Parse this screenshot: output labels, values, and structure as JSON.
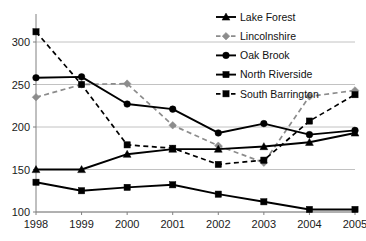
{
  "chart_data": {
    "type": "line",
    "title": "",
    "subtitle": "",
    "xlabel": "",
    "ylabel": "",
    "categories": [
      "1998",
      "1999",
      "2000",
      "2001",
      "2002",
      "2003",
      "2004",
      "2005"
    ],
    "x_tick_labels": [
      "1998",
      "1999",
      "2000",
      "2001",
      "2002",
      "2003",
      "2004",
      "2005"
    ],
    "y_tick_labels": [
      "100",
      "150",
      "200",
      "250",
      "300"
    ],
    "y_ticks": [
      100,
      150,
      200,
      250,
      300
    ],
    "ylim": [
      95,
      320
    ],
    "xlim": [
      1998,
      2005
    ],
    "grid": "horizontal",
    "legend_position": "top-right",
    "series": [
      {
        "name": "Lake Forest",
        "marker": "triangle",
        "line_style": "solid",
        "color": "#000000",
        "values": [
          150,
          150,
          168,
          174,
          174,
          177,
          182,
          193
        ]
      },
      {
        "name": "Lincolnshire",
        "marker": "diamond",
        "line_style": "dashed",
        "color": "#8c8c8c",
        "values": [
          235,
          250,
          251,
          202,
          178,
          158,
          236,
          243
        ]
      },
      {
        "name": "Oak Brook",
        "marker": "circle",
        "line_style": "solid",
        "color": "#000000",
        "values": [
          258,
          259,
          227,
          221,
          193,
          204,
          191,
          196
        ]
      },
      {
        "name": "North Riverside",
        "marker": "square",
        "line_style": "solid",
        "color": "#000000",
        "values": [
          135,
          125,
          129,
          132,
          121,
          112,
          103,
          103
        ]
      },
      {
        "name": "South Barrington",
        "marker": "square",
        "line_style": "dashed",
        "color": "#000000",
        "values": [
          312,
          250,
          179,
          175,
          156,
          161,
          207,
          238
        ]
      }
    ]
  },
  "legend": {
    "entries": [
      {
        "label": "Lake Forest"
      },
      {
        "label": "Lincolnshire"
      },
      {
        "label": "Oak Brook"
      },
      {
        "label": "North Riverside"
      },
      {
        "label": "South Barrington"
      }
    ]
  }
}
